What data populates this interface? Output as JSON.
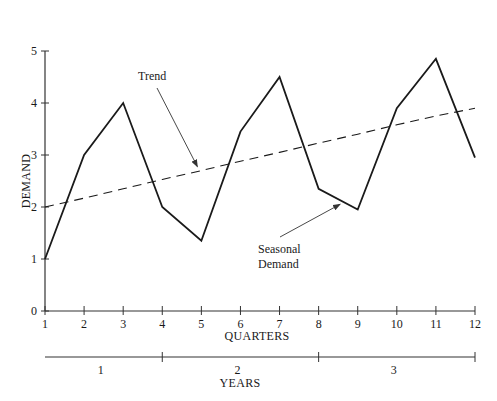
{
  "chart_data": {
    "type": "line",
    "title": "",
    "xlabel": "QUARTERS",
    "ylabel": "DEMAND",
    "secondary_xlabel": "YEARS",
    "x": [
      1,
      2,
      3,
      4,
      5,
      6,
      7,
      8,
      9,
      10,
      11,
      12
    ],
    "xlim": [
      1,
      12
    ],
    "ylim": [
      0,
      5
    ],
    "yticks": [
      0,
      1,
      2,
      3,
      4,
      5
    ],
    "xticks": [
      1,
      2,
      3,
      4,
      5,
      6,
      7,
      8,
      9,
      10,
      11,
      12
    ],
    "grid": false,
    "series": [
      {
        "name": "Seasonal Demand",
        "style": "solid",
        "values": [
          1.0,
          3.0,
          4.0,
          2.0,
          1.35,
          3.45,
          4.5,
          2.35,
          1.95,
          3.9,
          4.85,
          2.95
        ]
      },
      {
        "name": "Trend",
        "style": "dashed",
        "values": [
          2.0,
          2.17,
          2.35,
          2.53,
          2.7,
          2.88,
          3.05,
          3.23,
          3.4,
          3.58,
          3.75,
          3.9
        ]
      }
    ],
    "years": [
      {
        "label": "1",
        "start_quarter": 1,
        "end_quarter": 4
      },
      {
        "label": "2",
        "start_quarter": 4,
        "end_quarter": 8
      },
      {
        "label": "3",
        "start_quarter": 8,
        "end_quarter": 12
      }
    ],
    "annotations": [
      {
        "text": "Trend",
        "target_series": "Trend",
        "points_to_x": 5.0
      },
      {
        "text_lines": [
          "Seasonal",
          "Demand"
        ],
        "target_series": "Seasonal Demand",
        "points_to_x": 8.6
      }
    ]
  },
  "colors": {
    "line": "#1a1a1a",
    "axis": "#333333",
    "background": "#ffffff"
  }
}
